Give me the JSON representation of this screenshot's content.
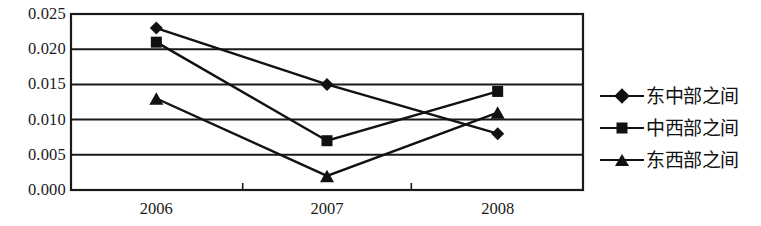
{
  "chart_data": {
    "type": "line",
    "title": "",
    "xlabel": "",
    "ylabel": "",
    "categories": [
      "2006",
      "2007",
      "2008"
    ],
    "ylim": [
      0.0,
      0.025
    ],
    "yticks": [
      "0.000",
      "0.005",
      "0.010",
      "0.015",
      "0.020",
      "0.025"
    ],
    "ytick_values": [
      0.0,
      0.005,
      0.01,
      0.015,
      0.02,
      0.025
    ],
    "grid": "horizontal",
    "legend_position": "right",
    "series": [
      {
        "name": "东中部之间",
        "marker": "diamond",
        "values": [
          0.023,
          0.015,
          0.008
        ]
      },
      {
        "name": "中西部之间",
        "marker": "square",
        "values": [
          0.021,
          0.007,
          0.014
        ]
      },
      {
        "name": "东西部之间",
        "marker": "triangle",
        "values": [
          0.013,
          0.002,
          0.011
        ]
      }
    ],
    "colors": {
      "series_line": "#111111",
      "marker": "#111111",
      "grid": "#1a1a1a",
      "axis": "#1a1a1a",
      "background": "#ffffff"
    }
  },
  "legend": {
    "items": [
      {
        "label": "东中部之间",
        "marker": "diamond-marker-icon"
      },
      {
        "label": "中西部之间",
        "marker": "square-marker-icon"
      },
      {
        "label": "东西部之间",
        "marker": "triangle-marker-icon"
      }
    ]
  },
  "axes": {
    "y_labels": [
      "0.025",
      "0.020",
      "0.015",
      "0.010",
      "0.005",
      "0.000"
    ],
    "x_labels": [
      "2006",
      "2007",
      "2008"
    ]
  }
}
